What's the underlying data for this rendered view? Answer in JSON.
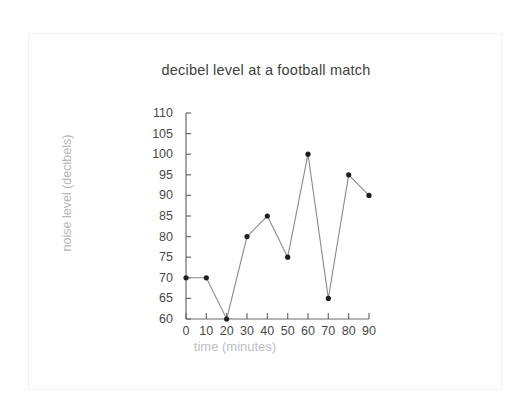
{
  "chart_data": {
    "type": "line",
    "title": "decibel level at a football match",
    "xlabel": "time (minutes)",
    "ylabel": "noise level (decibels)",
    "x": [
      0,
      10,
      20,
      30,
      40,
      50,
      60,
      70,
      80,
      90
    ],
    "values": [
      70,
      70,
      60,
      80,
      85,
      75,
      100,
      65,
      95,
      90
    ],
    "xlim": [
      0,
      90
    ],
    "ylim": [
      60,
      110
    ],
    "xticks": [
      "0",
      "10",
      "20",
      "30",
      "40",
      "50",
      "60",
      "70",
      "80",
      "90"
    ],
    "yticks": [
      "110",
      "105",
      "100",
      "95",
      "90",
      "85",
      "80",
      "75",
      "70",
      "65",
      "60"
    ],
    "grid": false,
    "legend": null,
    "marker": "circle",
    "line_color": "#8a8a8a",
    "marker_color": "#1f1f1f",
    "axis_color": "#6b6b6b",
    "title_color": "#3f3f3f",
    "axis_label_color": "#bdbdbd"
  }
}
